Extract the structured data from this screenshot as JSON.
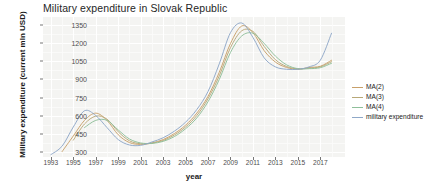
{
  "chart_data": {
    "type": "line",
    "title": "Military expenditure in Slovak Republic",
    "xlabel": "year",
    "ylabel": "Military expenditure (current mln USD)",
    "xlim": [
      1992.3,
      2019.2
    ],
    "ylim": [
      255,
      1420
    ],
    "grid": true,
    "legend_position": "right",
    "xticks": [
      1993,
      1995,
      1997,
      1999,
      2001,
      2003,
      2005,
      2007,
      2009,
      2011,
      2013,
      2015,
      2017
    ],
    "yticks": [
      300,
      450,
      600,
      750,
      900,
      1050,
      1200,
      1350
    ],
    "x": [
      1993,
      1994,
      1995,
      1996,
      1997,
      1998,
      1999,
      2000,
      2001,
      2002,
      2003,
      2004,
      2005,
      2006,
      2007,
      2008,
      2009,
      2010,
      2011,
      2012,
      2013,
      2014,
      2015,
      2016,
      2017,
      2018
    ],
    "series": [
      {
        "name": "MA(2)",
        "color": "#c8a06a",
        "values": [
          null,
          300,
          430,
          560,
          620,
          560,
          440,
          375,
          360,
          372,
          400,
          450,
          520,
          620,
          760,
          960,
          1200,
          1345,
          1290,
          1140,
          1045,
          1000,
          985,
          1000,
          1010,
          1060
        ]
      },
      {
        "name": "MA(3)",
        "color": "#b8a878",
        "values": [
          null,
          null,
          395,
          530,
          595,
          570,
          465,
          390,
          365,
          370,
          392,
          438,
          505,
          600,
          740,
          930,
          1165,
          1305,
          1300,
          1175,
          1065,
          1008,
          988,
          995,
          1005,
          1048
        ]
      },
      {
        "name": "MA(4)",
        "color": "#8fbf9a",
        "values": [
          null,
          null,
          null,
          500,
          560,
          560,
          480,
          405,
          372,
          368,
          385,
          425,
          490,
          580,
          715,
          900,
          1125,
          1262,
          1285,
          1200,
          1095,
          1022,
          990,
          990,
          998,
          1035
        ]
      },
      {
        "name": "military expenditure",
        "color": "#8fa8c8",
        "values": [
          275,
          345,
          505,
          640,
          600,
          500,
          400,
          355,
          352,
          380,
          415,
          470,
          545,
          650,
          800,
          1030,
          1290,
          1370,
          1250,
          1080,
          1005,
          985,
          985,
          1005,
          1060,
          1285
        ]
      }
    ],
    "legend_entries": [
      "MA(2)",
      "MA(3)",
      "MA(4)",
      "military expenditure"
    ]
  },
  "colors": {
    "panel_background": "#f4f4f2",
    "grid": "#ffffff",
    "axis_text": "#4d4d4d",
    "title_text": "#262626"
  }
}
